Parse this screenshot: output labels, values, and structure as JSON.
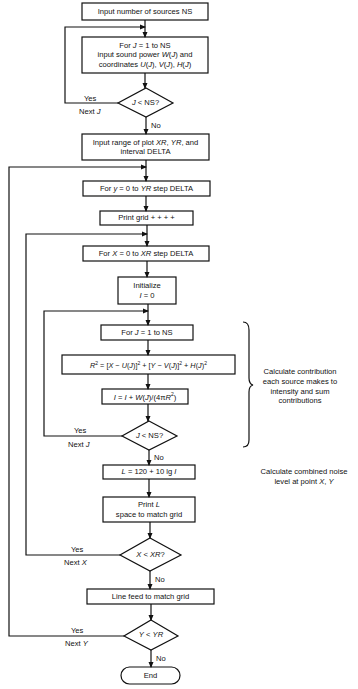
{
  "flowchart": {
    "nodes": [
      {
        "id": "input_ns",
        "type": "process",
        "lines": [
          "Input number of sources NS"
        ]
      },
      {
        "id": "input_sources",
        "type": "process",
        "lines": [
          "For J = 1 to NS",
          "input sound power W(J) and",
          "coordinates U(J), V(J), H(J)"
        ]
      },
      {
        "id": "decide_j1",
        "type": "decision",
        "lines": [
          "J < NS?"
        ]
      },
      {
        "id": "input_range",
        "type": "process",
        "lines": [
          "Input range of plot XR, YR, and",
          "interval DELTA"
        ]
      },
      {
        "id": "loop_y",
        "type": "process",
        "lines": [
          "For y = 0 to YR step DELTA"
        ]
      },
      {
        "id": "print_grid",
        "type": "process",
        "lines": [
          "Print grid + + + +"
        ]
      },
      {
        "id": "loop_x",
        "type": "process",
        "lines": [
          "For X = 0 to XR step DELTA"
        ]
      },
      {
        "id": "init_i",
        "type": "process",
        "lines": [
          "Initialize",
          "I = 0"
        ]
      },
      {
        "id": "loop_j",
        "type": "process",
        "lines": [
          "For J = 1 to NS"
        ]
      },
      {
        "id": "calc_r2",
        "type": "process",
        "lines": [
          "R² = [X − U(J)]² + [Y − V(J)]² + H(J)²"
        ]
      },
      {
        "id": "sum_i",
        "type": "process",
        "lines": [
          "I = I + W(J)/(4πR²)"
        ]
      },
      {
        "id": "decide_j2",
        "type": "decision",
        "lines": [
          "J < NS?"
        ]
      },
      {
        "id": "calc_l",
        "type": "process",
        "lines": [
          "L = 120 + 10 lg I"
        ]
      },
      {
        "id": "print_l",
        "type": "process",
        "lines": [
          "Print L",
          "space to match grid"
        ]
      },
      {
        "id": "decide_x",
        "type": "decision",
        "lines": [
          "X < XR?"
        ]
      },
      {
        "id": "line_feed",
        "type": "process",
        "lines": [
          "Line feed to match grid"
        ]
      },
      {
        "id": "decide_y",
        "type": "decision",
        "lines": [
          "Y < YR"
        ]
      },
      {
        "id": "end",
        "type": "terminal",
        "lines": [
          "End"
        ]
      }
    ],
    "edge_labels": {
      "j1_yes": "Yes",
      "j1_next": "Next J",
      "j1_no": "No",
      "j2_yes": "Yes",
      "j2_next": "Next J",
      "j2_no": "No",
      "x_yes": "Yes",
      "x_next": "Next X",
      "x_no": "No",
      "y_yes": "Yes",
      "y_next": "Next Y",
      "y_no": "No"
    },
    "annotations": {
      "contribution": [
        "Calculate contribution",
        "each source makes to",
        "intensity and sum",
        "contributions"
      ],
      "combined": [
        "Calculate combined noise",
        "level at point X, Y"
      ]
    }
  }
}
